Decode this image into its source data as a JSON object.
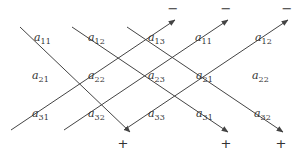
{
  "diagram": {
    "colors": {
      "line": "#444444",
      "text": "#333333",
      "background": "#ffffff"
    },
    "elements": [
      {
        "base": "a",
        "sub": "11",
        "x": 34,
        "y": 41
      },
      {
        "base": "a",
        "sub": "12",
        "x": 88,
        "y": 41
      },
      {
        "base": "a",
        "sub": "13",
        "x": 148,
        "y": 41
      },
      {
        "base": "a",
        "sub": "11",
        "x": 195,
        "y": 41
      },
      {
        "base": "a",
        "sub": "12",
        "x": 255,
        "y": 41
      },
      {
        "base": "a",
        "sub": "21",
        "x": 32,
        "y": 79
      },
      {
        "base": "a",
        "sub": "22",
        "x": 88,
        "y": 79
      },
      {
        "base": "a",
        "sub": "23",
        "x": 148,
        "y": 79
      },
      {
        "base": "a",
        "sub": "21",
        "x": 196,
        "y": 79
      },
      {
        "base": "a",
        "sub": "22",
        "x": 252,
        "y": 79
      },
      {
        "base": "a",
        "sub": "31",
        "x": 32,
        "y": 117
      },
      {
        "base": "a",
        "sub": "32",
        "x": 88,
        "y": 117
      },
      {
        "base": "a",
        "sub": "33",
        "x": 148,
        "y": 117
      },
      {
        "base": "a",
        "sub": "31",
        "x": 196,
        "y": 117
      },
      {
        "base": "a",
        "sub": "32",
        "x": 254,
        "y": 117
      }
    ],
    "down_lines": [
      {
        "x1": 20,
        "y1": 27,
        "x2": 130,
        "y2": 132,
        "sign": "+",
        "sx": 123,
        "sy": 148
      },
      {
        "x1": 72,
        "y1": 27,
        "x2": 228,
        "y2": 132,
        "sign": "+",
        "sx": 226,
        "sy": 148
      },
      {
        "x1": 127,
        "y1": 27,
        "x2": 283,
        "y2": 132,
        "sign": "+",
        "sx": 281,
        "sy": 148
      }
    ],
    "up_lines": [
      {
        "x1": 11,
        "y1": 130,
        "x2": 175,
        "y2": 20,
        "sign": "−",
        "sx": 173,
        "sy": 13
      },
      {
        "x1": 64,
        "y1": 130,
        "x2": 228,
        "y2": 20,
        "sign": "−",
        "sx": 226,
        "sy": 13
      },
      {
        "x1": 124,
        "y1": 130,
        "x2": 288,
        "y2": 20,
        "sign": "−",
        "sx": 287,
        "sy": 13
      }
    ]
  }
}
